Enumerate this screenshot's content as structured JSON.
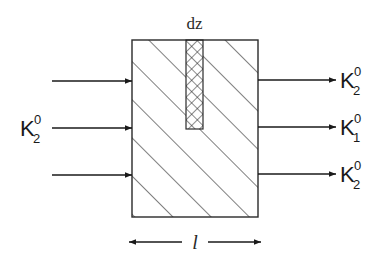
{
  "diagram": {
    "type": "schematic",
    "slice_label": "dz",
    "length_label": "l",
    "input": {
      "label_base": "K",
      "label_sup": "0",
      "label_sub": "2",
      "arrow_count": 3
    },
    "outputs": [
      {
        "label_base": "K",
        "label_sup": "0",
        "label_sub": "2"
      },
      {
        "label_base": "K",
        "label_sup": "0",
        "label_sub": "1"
      },
      {
        "label_base": "K",
        "label_sup": "0",
        "label_sub": "2"
      }
    ],
    "colors": {
      "line": "#2a2a2a",
      "background": "#ffffff"
    }
  }
}
